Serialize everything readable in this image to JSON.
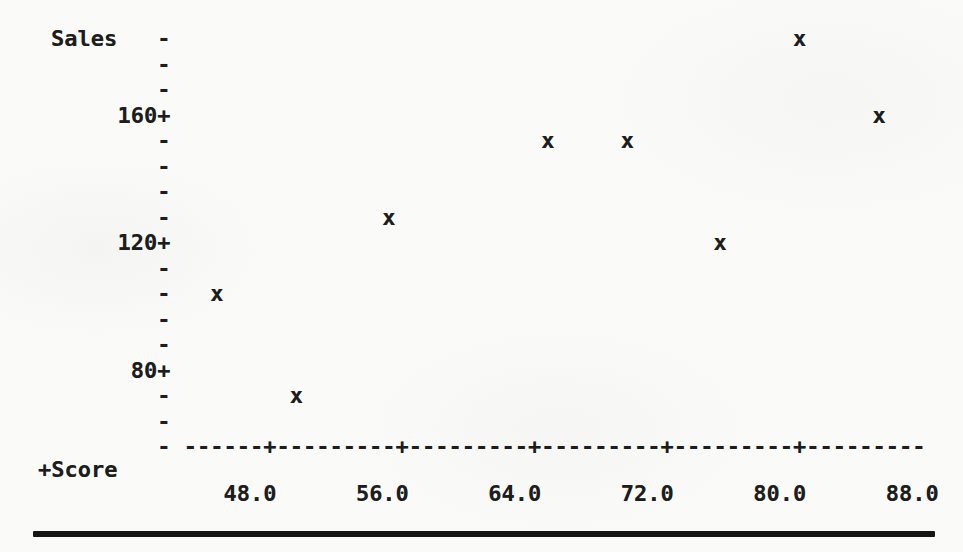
{
  "chart_data": {
    "type": "scatter",
    "style": "ascii-character-plot",
    "marker": "x",
    "ylabel": "Sales",
    "xlabel": "+Score",
    "points": [
      {
        "score": 45,
        "sales": 104
      },
      {
        "score": 50,
        "sales": 72
      },
      {
        "score": 55,
        "sales": 128
      },
      {
        "score": 65,
        "sales": 152
      },
      {
        "score": 70,
        "sales": 152
      },
      {
        "score": 75,
        "sales": 120
      },
      {
        "score": 80,
        "sales": 184
      },
      {
        "score": 85,
        "sales": 160
      }
    ],
    "x_tick_labels": [
      "48.0",
      "56.0",
      "64.0",
      "72.0",
      "80.0",
      "88.0"
    ],
    "x_tick_values": [
      48,
      56,
      64,
      72,
      80,
      88
    ],
    "y_tick_labels": [
      "160",
      "120",
      "80"
    ],
    "y_tick_values": [
      160,
      120,
      80
    ],
    "xlim": [
      43.2,
      88.0
    ],
    "ylim": [
      56,
      184
    ],
    "x_units_per_column": 0.8,
    "y_units_per_row": 8,
    "dash_char": "-",
    "tick_char": "+",
    "grid": false,
    "legend": null
  },
  "colors": {
    "paper": "#fafaf8",
    "ink": "#1d1d1d",
    "bottom_rule": "#161616"
  }
}
